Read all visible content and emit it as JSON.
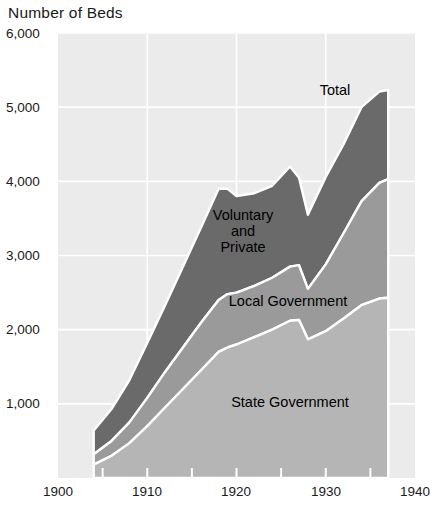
{
  "chart_data": {
    "type": "area",
    "title": "Number of Beds",
    "xlabel": "",
    "ylabel": "Number of Beds",
    "stacked": true,
    "grid": true,
    "legend_position": "inline-annotations",
    "xlim": [
      1900,
      1940
    ],
    "ylim": [
      0,
      6000
    ],
    "xticks": [
      1900,
      1910,
      1920,
      1930,
      1940
    ],
    "xticklabels": [
      "1900",
      "1910",
      "1920",
      "1930",
      "1940"
    ],
    "xminorticks": [
      1905,
      1915,
      1925,
      1935
    ],
    "yticks": [
      1000,
      2000,
      3000,
      4000,
      5000,
      6000
    ],
    "yticklabels": [
      "1,000",
      "2,000",
      "3,000",
      "4,000",
      "5,000",
      "6,000"
    ],
    "x": [
      1904,
      1906,
      1908,
      1910,
      1912,
      1914,
      1916,
      1918,
      1919,
      1920,
      1922,
      1924,
      1926,
      1927,
      1928,
      1930,
      1932,
      1934,
      1936,
      1937
    ],
    "series": [
      {
        "name": "State Government",
        "color": "#b5b5b5",
        "values": [
          180,
          300,
          470,
          700,
          950,
          1200,
          1450,
          1700,
          1760,
          1800,
          1900,
          2000,
          2120,
          2130,
          1870,
          1980,
          2150,
          2330,
          2420,
          2430
        ]
      },
      {
        "name": "Local Government",
        "color": "#9a9a9a",
        "values": [
          140,
          200,
          280,
          380,
          480,
          560,
          640,
          700,
          720,
          700,
          690,
          700,
          730,
          740,
          680,
          900,
          1150,
          1400,
          1560,
          1600
        ]
      },
      {
        "name": "Voluntary and Private",
        "color": "#6a6a6a",
        "values": [
          320,
          430,
          570,
          740,
          900,
          1090,
          1280,
          1500,
          1420,
          1300,
          1250,
          1240,
          1350,
          1180,
          1000,
          1180,
          1200,
          1270,
          1230,
          1200
        ]
      }
    ],
    "totals": [
      640,
      930,
      1320,
      1820,
      2330,
      2850,
      3370,
      3900,
      3900,
      3800,
      3840,
      3940,
      4200,
      4050,
      3550,
      4060,
      4500,
      5000,
      5210,
      5230
    ],
    "annotations": [
      {
        "text": "Total",
        "x": 1931,
        "y": 5380
      },
      {
        "text": "Voluntary\nand\nPrivate",
        "x": 1919.5,
        "y": 3320
      },
      {
        "text": "Local Government",
        "x": 1924.5,
        "y": 2560
      },
      {
        "text": "State Government",
        "x": 1925.5,
        "y": 1060
      }
    ]
  },
  "labels": {
    "axis_title": "Number of Beds",
    "total": "Total",
    "voluntary_line1": "Voluntary",
    "voluntary_line2": "and",
    "voluntary_line3": "Private",
    "local_government": "Local Government",
    "state_government": "State Government"
  },
  "colors": {
    "plot_background": "#ebebeb",
    "gridline": "#ffffff",
    "state_government": "#b5b5b5",
    "local_government": "#9a9a9a",
    "voluntary_private": "#6a6a6a",
    "page_background": "#ffffff",
    "text": "#1a1a1a"
  }
}
